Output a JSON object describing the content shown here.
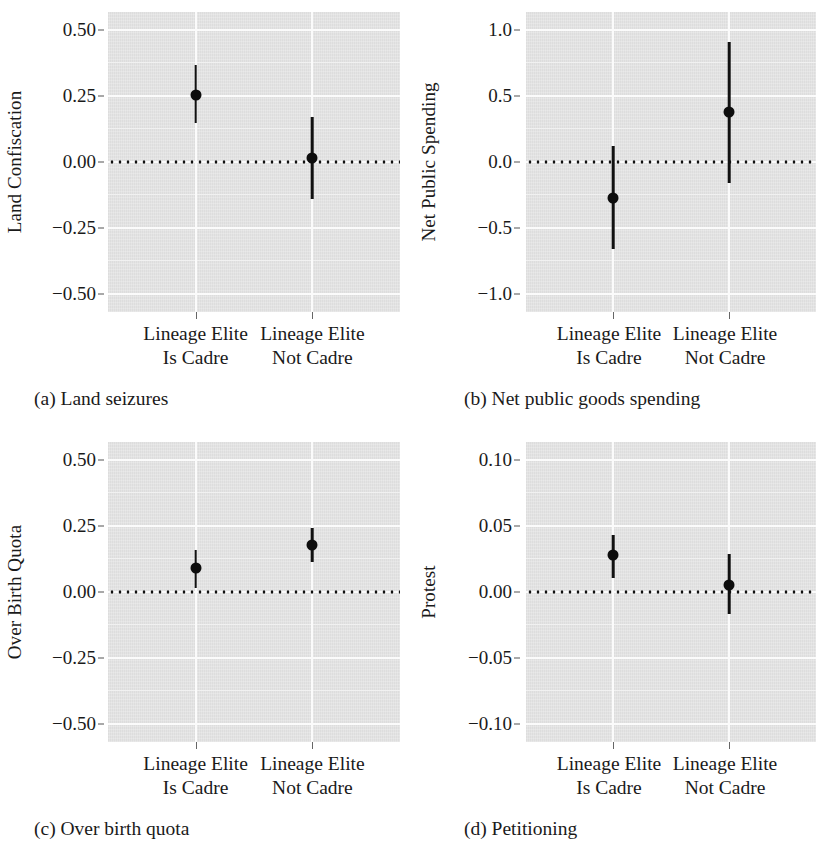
{
  "figure": {
    "group_labels": [
      {
        "line1": "Lineage Elite",
        "line2": "Is Cadre"
      },
      {
        "line1": "Lineage Elite",
        "line2": "Not Cadre"
      }
    ]
  },
  "chart_data": [
    {
      "type": "scatter",
      "panel": "a",
      "caption": "(a) Land seizures",
      "title": "",
      "ylabel": "Land Confiscation",
      "xlabel": "",
      "categories": [
        "Lineage Elite Is Cadre",
        "Lineage Elite Not Cadre"
      ],
      "yticks": [
        "0.50",
        "0.25",
        "0.00",
        "-0.25",
        "-0.50"
      ],
      "ytick_values": [
        0.5,
        0.25,
        0.0,
        -0.25,
        -0.5
      ],
      "ylim": [
        -0.57,
        0.57
      ],
      "grid": true,
      "zero_reference_line": 0.0,
      "values": [
        0.255,
        0.015
      ],
      "ci_low": [
        0.15,
        -0.14
      ],
      "ci_high": [
        0.37,
        0.17
      ]
    },
    {
      "type": "scatter",
      "panel": "b",
      "caption": "(b) Net public goods spending",
      "title": "",
      "ylabel": "Net Public Spending",
      "xlabel": "",
      "categories": [
        "Lineage Elite Is Cadre",
        "Lineage Elite Not Cadre"
      ],
      "yticks": [
        "1.0",
        "0.5",
        "0.0",
        "-0.5",
        "-1.0"
      ],
      "ytick_values": [
        1.0,
        0.5,
        0.0,
        -0.5,
        -1.0
      ],
      "ylim": [
        -1.14,
        1.14
      ],
      "grid": true,
      "zero_reference_line": 0.0,
      "values": [
        -0.27,
        0.38
      ],
      "ci_low": [
        -0.66,
        -0.16
      ],
      "ci_high": [
        0.12,
        0.91
      ]
    },
    {
      "type": "scatter",
      "panel": "c",
      "caption": "(c) Over birth quota",
      "title": "",
      "ylabel": "Over Birth Quota",
      "xlabel": "",
      "categories": [
        "Lineage Elite Is Cadre",
        "Lineage Elite Not Cadre"
      ],
      "yticks": [
        "0.50",
        "0.25",
        "0.00",
        "-0.25",
        "-0.50"
      ],
      "ytick_values": [
        0.5,
        0.25,
        0.0,
        -0.25,
        -0.5
      ],
      "ylim": [
        -0.57,
        0.57
      ],
      "grid": true,
      "zero_reference_line": 0.0,
      "values": [
        0.09,
        0.18
      ],
      "ci_low": [
        0.015,
        0.115
      ],
      "ci_high": [
        0.16,
        0.245
      ]
    },
    {
      "type": "scatter",
      "panel": "d",
      "caption": "(d) Petitioning",
      "title": "",
      "ylabel": "Protest",
      "xlabel": "",
      "categories": [
        "Lineage Elite Is Cadre",
        "Lineage Elite Not Cadre"
      ],
      "yticks": [
        "0.10",
        "0.05",
        "0.00",
        "-0.05",
        "-0.10"
      ],
      "ytick_values": [
        0.1,
        0.05,
        0.0,
        -0.05,
        -0.1
      ],
      "ylim": [
        -0.114,
        0.114
      ],
      "grid": true,
      "zero_reference_line": 0.0,
      "values": [
        0.028,
        0.005
      ],
      "ci_low": [
        0.011,
        -0.017
      ],
      "ci_high": [
        0.043,
        0.029
      ]
    }
  ],
  "colors": {
    "panel_background": "#e4e4e4",
    "gridline": "#fbfbfb",
    "point": "#0d0d0d",
    "errorbar": "#111111",
    "text": "#1a1a1a"
  }
}
